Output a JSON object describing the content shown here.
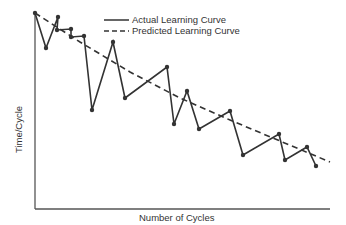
{
  "chart_data": {
    "type": "line",
    "title": "",
    "xlabel": "Number of Cycles",
    "ylabel": "Time/Cycle",
    "grid": false,
    "legend_position": "top-center",
    "axis_ticks": "none",
    "series": [
      {
        "name": "Actual Learning Curve",
        "style": "solid",
        "markers": true,
        "points_px": [
          [
            35,
            13
          ],
          [
            46,
            48
          ],
          [
            58,
            17
          ],
          [
            57,
            30
          ],
          [
            71,
            29
          ],
          [
            71,
            37
          ],
          [
            84,
            36
          ],
          [
            92,
            110
          ],
          [
            113,
            42
          ],
          [
            125,
            98
          ],
          [
            167,
            67
          ],
          [
            174,
            124
          ],
          [
            187,
            91
          ],
          [
            199,
            129
          ],
          [
            230,
            111
          ],
          [
            243,
            155
          ],
          [
            279,
            134
          ],
          [
            285,
            160
          ],
          [
            307,
            147
          ],
          [
            316,
            166
          ]
        ]
      },
      {
        "name": "Predicted Learning Curve",
        "style": "dashed",
        "markers": false,
        "points_px": [
          [
            35,
            13
          ],
          [
            80,
            42
          ],
          [
            130,
            72
          ],
          [
            180,
            98
          ],
          [
            230,
            120
          ],
          [
            280,
            141
          ],
          [
            330,
            162
          ]
        ]
      }
    ],
    "plot_area_px": {
      "x0": 35,
      "y0": 13,
      "x1": 330,
      "y1": 209
    }
  },
  "legend": {
    "actual": "Actual Learning Curve",
    "predicted": "Predicted Learning Curve"
  },
  "axes": {
    "x_label": "Number of Cycles",
    "y_label": "Time/Cycle"
  }
}
